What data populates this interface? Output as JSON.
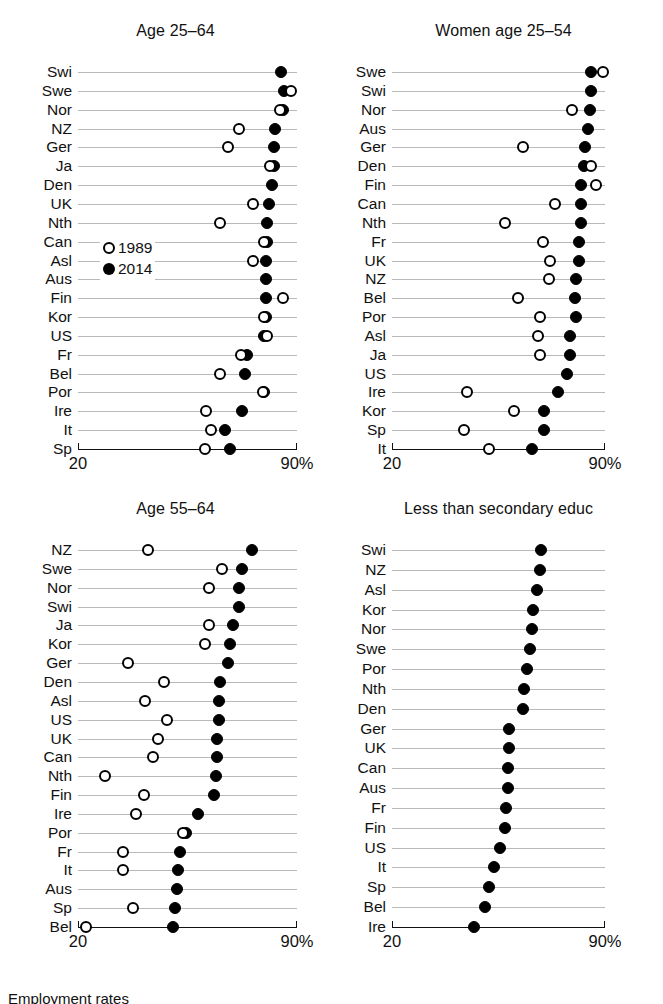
{
  "figure": {
    "caption": "Employment rates",
    "legend": {
      "series_1989": "1989",
      "series_2014": "2014"
    },
    "axis": {
      "left_label": "20",
      "right_label": "90%"
    },
    "colors": {
      "ink": "#000000",
      "gridline": "#b9b9b9",
      "open_fill": "#ffffff"
    }
  },
  "chart_data": [
    {
      "type": "scatter",
      "subtype": "dot-plot",
      "title": "Age 25–64",
      "xlabel": "",
      "ylabel": "",
      "xlim": [
        20,
        90
      ],
      "xticks": [
        20,
        90
      ],
      "xticklabels": [
        "20",
        "90%"
      ],
      "grid": true,
      "legend_position": "inside-left",
      "categories": [
        "Swi",
        "Swe",
        "Nor",
        "NZ",
        "Ger",
        "Ja",
        "Den",
        "UK",
        "Nth",
        "Can",
        "Asl",
        "Aus",
        "Fin",
        "Kor",
        "US",
        "Fr",
        "Bel",
        "Por",
        "Ire",
        "It",
        "Sp"
      ],
      "series": [
        {
          "name": "1989",
          "marker": "open-circle",
          "values": [
            null,
            88.0,
            84.5,
            71.5,
            68.0,
            81.5,
            null,
            76.0,
            65.5,
            79.5,
            76.0,
            null,
            85.5,
            79.5,
            80.5,
            72.0,
            65.5,
            79.0,
            61.0,
            62.5,
            60.5
          ]
        },
        {
          "name": "2014",
          "marker": "filled-circle",
          "values": [
            85.0,
            86.0,
            85.5,
            83.0,
            82.5,
            82.5,
            82.0,
            81.0,
            80.5,
            80.5,
            80.0,
            80.0,
            80.0,
            80.0,
            79.5,
            74.0,
            73.5,
            79.5,
            72.5,
            67.0,
            68.5
          ]
        }
      ]
    },
    {
      "type": "scatter",
      "subtype": "dot-plot",
      "title": "Women age 25–54",
      "xlabel": "",
      "ylabel": "",
      "xlim": [
        20,
        90
      ],
      "xticks": [
        20,
        90
      ],
      "xticklabels": [
        "20",
        "90%"
      ],
      "grid": true,
      "legend_position": "none",
      "categories": [
        "Swe",
        "Swi",
        "Nor",
        "Aus",
        "Ger",
        "Den",
        "Fin",
        "Can",
        "Nth",
        "Fr",
        "UK",
        "NZ",
        "Bel",
        "Por",
        "Asl",
        "Ja",
        "US",
        "Ire",
        "Kor",
        "Sp",
        "It"
      ],
      "series": [
        {
          "name": "1989",
          "marker": "open-circle",
          "values": [
            89.5,
            null,
            79.0,
            null,
            63.0,
            85.5,
            87.0,
            73.5,
            57.0,
            69.5,
            72.0,
            71.5,
            61.5,
            68.5,
            68.0,
            68.5,
            null,
            44.5,
            60.0,
            43.5,
            52.0
          ]
        },
        {
          "name": "2014",
          "marker": "filled-circle",
          "values": [
            85.5,
            85.5,
            85.0,
            84.5,
            83.5,
            83.0,
            82.0,
            82.0,
            82.0,
            81.5,
            81.5,
            80.5,
            80.0,
            80.5,
            78.5,
            78.5,
            77.5,
            74.5,
            70.0,
            70.0,
            66.0
          ]
        }
      ]
    },
    {
      "type": "scatter",
      "subtype": "dot-plot",
      "title": "Age 55–64",
      "xlabel": "",
      "ylabel": "",
      "xlim": [
        20,
        90
      ],
      "xticks": [
        20,
        90
      ],
      "xticklabels": [
        "20",
        "90%"
      ],
      "grid": true,
      "legend_position": "none",
      "categories": [
        "NZ",
        "Swe",
        "Nor",
        "Swi",
        "Ja",
        "Kor",
        "Ger",
        "Den",
        "Asl",
        "US",
        "UK",
        "Can",
        "Nth",
        "Fin",
        "Ire",
        "Por",
        "Fr",
        "It",
        "Aus",
        "Sp",
        "Bel"
      ],
      "series": [
        {
          "name": "1989",
          "marker": "open-circle",
          "values": [
            42.5,
            66.0,
            62.0,
            null,
            62.0,
            60.5,
            36.0,
            47.5,
            41.5,
            48.5,
            45.5,
            44.0,
            28.5,
            41.0,
            38.5,
            53.5,
            34.5,
            34.5,
            null,
            37.5,
            22.5
          ]
        },
        {
          "name": "2014",
          "marker": "filled-circle",
          "values": [
            75.5,
            72.5,
            71.5,
            71.5,
            69.5,
            68.5,
            68.0,
            65.5,
            65.0,
            65.0,
            64.5,
            64.5,
            64.0,
            63.5,
            58.5,
            54.5,
            52.5,
            52.0,
            51.5,
            51.0,
            50.5
          ]
        }
      ]
    },
    {
      "type": "scatter",
      "subtype": "dot-plot",
      "title": "Less than secondary educ",
      "xlabel": "",
      "ylabel": "",
      "xlim": [
        20,
        90
      ],
      "xticks": [
        20,
        90
      ],
      "xticklabels": [
        "20",
        "90%"
      ],
      "grid": true,
      "legend_position": "none",
      "categories": [
        "Swi",
        "NZ",
        "Asl",
        "Kor",
        "Nor",
        "Swe",
        "Por",
        "Nth",
        "Den",
        "Ger",
        "UK",
        "Can",
        "Aus",
        "Fr",
        "Fin",
        "US",
        "It",
        "Sp",
        "Bel",
        "Ire"
      ],
      "series": [
        {
          "name": "2014",
          "marker": "filled-circle",
          "values": [
            69.0,
            68.5,
            67.5,
            66.5,
            66.0,
            65.5,
            64.5,
            63.5,
            63.0,
            58.5,
            58.5,
            58.0,
            58.0,
            57.5,
            57.0,
            55.5,
            53.5,
            52.0,
            50.5,
            47.0
          ]
        }
      ]
    }
  ]
}
